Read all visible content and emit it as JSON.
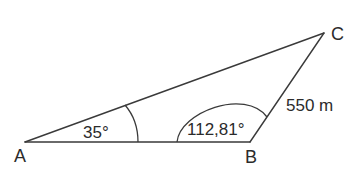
{
  "diagram": {
    "type": "triangle",
    "vertices": {
      "A": {
        "label": "A"
      },
      "B": {
        "label": "B"
      },
      "C": {
        "label": "C"
      }
    },
    "angles": {
      "A": {
        "label": "35°",
        "value": 35
      },
      "B": {
        "label": "112,81°",
        "value": 112.81
      }
    },
    "sides": {
      "BC": {
        "label": "550 m",
        "value": 550,
        "unit": "m"
      }
    },
    "colors": {
      "stroke": "#3a3a3a",
      "text": "#2b2b2b",
      "background": "#ffffff"
    }
  }
}
